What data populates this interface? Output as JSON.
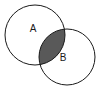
{
  "figure": {
    "kind": "venn-diagram",
    "background_color": "#ffffff",
    "width": 99,
    "height": 97
  },
  "style": {
    "stroke_color": "#1a1a1a",
    "stroke_width": 1,
    "circle_fill": "none",
    "intersection_fill": "#595959",
    "label_color": "#1a1a1a",
    "label_font_size": 10
  },
  "sets": [
    {
      "id": "A",
      "label": "A",
      "label_x": 33,
      "label_y": 29,
      "cx": 35,
      "cy": 35,
      "r": 30,
      "fill": "none"
    },
    {
      "id": "B",
      "label": "B",
      "label_x": 63,
      "label_y": 58,
      "cx": 67,
      "cy": 57,
      "r": 28,
      "fill": "none"
    }
  ],
  "intersection": {
    "id": "A-and-B",
    "label": "",
    "fill": "#595959",
    "shaded": true,
    "vertex_top_x": 53,
    "vertex_top_y": 28,
    "vertex_bottom_x": 42,
    "vertex_bottom_y": 64
  },
  "chart_data": {
    "type": "diagram",
    "subtype": "venn",
    "title": "",
    "xlabel": "",
    "ylabel": "",
    "categories": [
      "A",
      "B"
    ],
    "regions": [
      {
        "name": "A only",
        "shaded": false,
        "value": null
      },
      {
        "name": "A ∩ B",
        "shaded": true,
        "value": null
      },
      {
        "name": "B only",
        "shaded": false,
        "value": null
      }
    ],
    "legend": [],
    "annotations": [
      "A",
      "B"
    ]
  }
}
